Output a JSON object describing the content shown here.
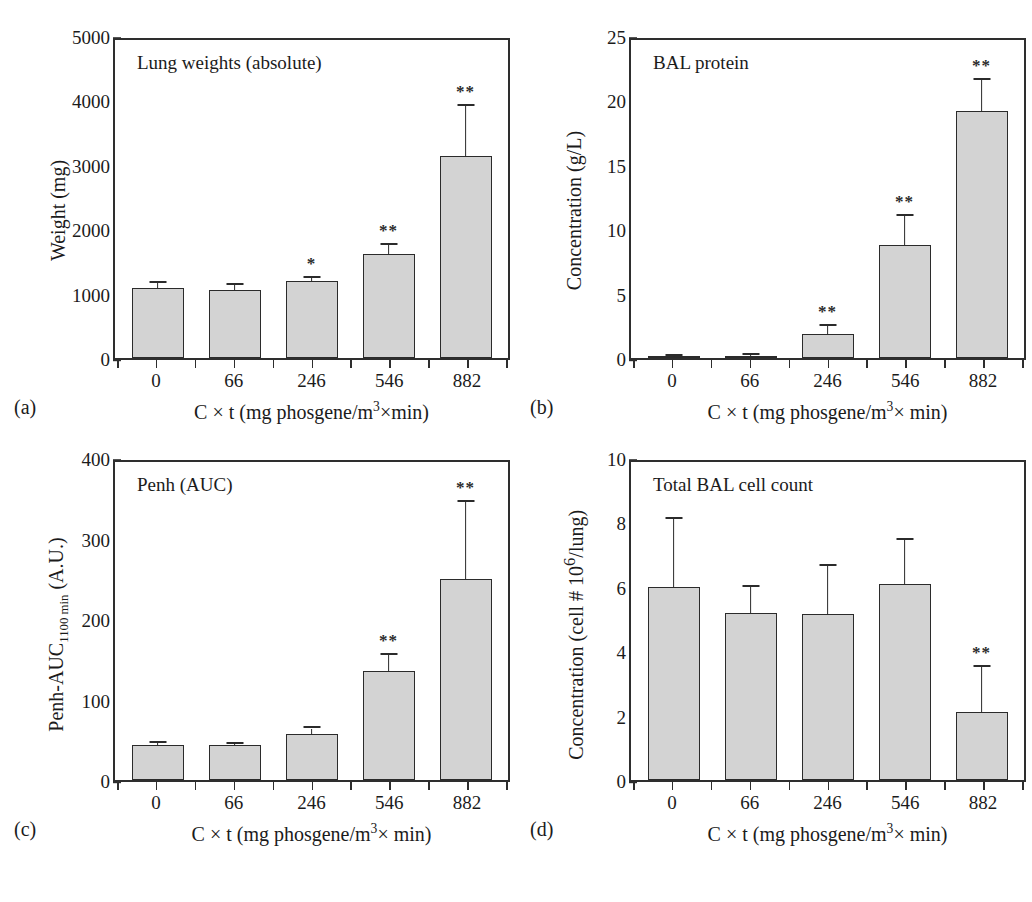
{
  "figure": {
    "shared_xlabel": "C × t (mg phosgene/m3× min)",
    "categories": [
      "0",
      "66",
      "246",
      "546",
      "882"
    ]
  },
  "panels": [
    {
      "letter": "(a)",
      "title": "Lung weights (absolute)",
      "ylabel": "Weight (mg)",
      "ylabel_sub": "",
      "xlabel": "C × t (mg phosgene/m3×min)",
      "yticks": [
        "0",
        "1000",
        "2000",
        "3000",
        "4000",
        "5000"
      ]
    },
    {
      "letter": "(b)",
      "title": "BAL protein",
      "ylabel": "Concentration (g/L)",
      "ylabel_sub": "",
      "xlabel": "C × t (mg phosgene/m3× min)",
      "yticks": [
        "0",
        "5",
        "10",
        "15",
        "20",
        "25"
      ]
    },
    {
      "letter": "(c)",
      "title": "Penh (AUC)",
      "ylabel": "Penh-AUC",
      "ylabel_sub": "1100 min",
      "ylabel_tail": " (A.U.)",
      "xlabel": "C × t (mg phosgene/m3× min)",
      "yticks": [
        "0",
        "100",
        "200",
        "300",
        "400"
      ]
    },
    {
      "letter": "(d)",
      "title": "Total BAL cell count",
      "ylabel": "Concentration (cell # 10",
      "ylabel_sup": "6",
      "ylabel_tail": "/lung)",
      "xlabel": "C × t (mg phosgene/m3× min)",
      "yticks": [
        "0",
        "2",
        "4",
        "6",
        "8",
        "10"
      ]
    }
  ],
  "chart_data": [
    {
      "type": "bar",
      "panel": "a",
      "title": "Lung weights (absolute)",
      "xlabel": "C × t (mg phosgene/m3×min)",
      "ylabel": "Weight (mg)",
      "categories": [
        "0",
        "66",
        "246",
        "546",
        "882"
      ],
      "values": [
        1090,
        1060,
        1190,
        1610,
        3140
      ],
      "errors_upper": [
        1170,
        1130,
        1240,
        1760,
        3920
      ],
      "significance": [
        "",
        "",
        "*",
        "**",
        "**"
      ],
      "ylim": [
        0,
        5000
      ],
      "ytick_step": 1000,
      "yminor_step": 500,
      "grid": false,
      "legend": "none"
    },
    {
      "type": "bar",
      "panel": "b",
      "title": "BAL protein",
      "xlabel": "C × t (mg phosgene/m3× min)",
      "ylabel": "Concentration (g/L)",
      "categories": [
        "0",
        "66",
        "246",
        "546",
        "882"
      ],
      "values": [
        0.1,
        0.18,
        1.9,
        8.8,
        19.2
      ],
      "errors_upper": [
        0.15,
        0.25,
        2.5,
        11.0,
        21.6
      ],
      "significance": [
        "",
        "",
        "**",
        "**",
        "**"
      ],
      "ylim": [
        0,
        25
      ],
      "ytick_step": 5,
      "yminor_step": 2.5,
      "grid": false,
      "legend": "none"
    },
    {
      "type": "bar",
      "panel": "c",
      "title": "Penh (AUC)",
      "xlabel": "C × t (mg phosgene/m3× min)",
      "ylabel": "Penh-AUC1100 min (A.U.)",
      "categories": [
        "0",
        "66",
        "246",
        "546",
        "882"
      ],
      "values": [
        44,
        43,
        57,
        135,
        250
      ],
      "errors_upper": [
        46,
        45,
        64,
        155,
        345
      ],
      "significance": [
        "",
        "",
        "",
        "**",
        "**"
      ],
      "ylim": [
        0,
        400
      ],
      "ytick_step": 100,
      "yminor_step": 50,
      "grid": false,
      "legend": "none"
    },
    {
      "type": "bar",
      "panel": "d",
      "title": "Total BAL cell count",
      "xlabel": "C × t (mg phosgene/m3× min)",
      "ylabel": "Concentration (cell # 106/lung)",
      "categories": [
        "0",
        "66",
        "246",
        "546",
        "882"
      ],
      "values": [
        6.0,
        5.2,
        5.15,
        6.1,
        2.1
      ],
      "errors_upper": [
        8.1,
        6.0,
        6.65,
        7.45,
        3.5
      ],
      "significance": [
        "",
        "",
        "",
        "",
        "**"
      ],
      "ylim": [
        0,
        10
      ],
      "ytick_step": 2,
      "yminor_step": 1,
      "grid": false,
      "legend": "none"
    }
  ]
}
